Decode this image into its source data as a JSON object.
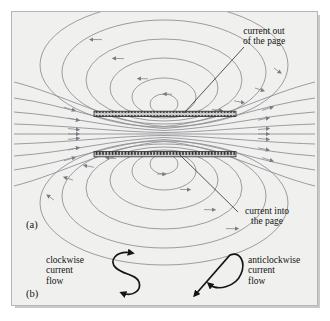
{
  "figure": {
    "panel_a_label": "(a)",
    "panel_b_label": "(b)",
    "background_color": "#f0f0ee",
    "border_color": "#b6b6b6",
    "field_line_color": "#8d8d93",
    "arrow_color": "#7b7b83",
    "conductor_color": "#3a3a3a",
    "text_color": "#141414"
  },
  "annotations": {
    "current_out": {
      "line1": "current out",
      "line2": "of the page"
    },
    "current_into": {
      "line1": "current into",
      "line2": "the page"
    }
  },
  "legend": {
    "clockwise": {
      "line1": "clockwise",
      "line2": "current",
      "line3": "flow",
      "symbol": "s-curve-clockwise-arrow"
    },
    "anticlockwise": {
      "line1": "anticlockwise",
      "line2": "current",
      "line3": "flow",
      "symbol": "z-curve-anticlockwise-arrow"
    }
  },
  "caption": {
    "text": ""
  }
}
